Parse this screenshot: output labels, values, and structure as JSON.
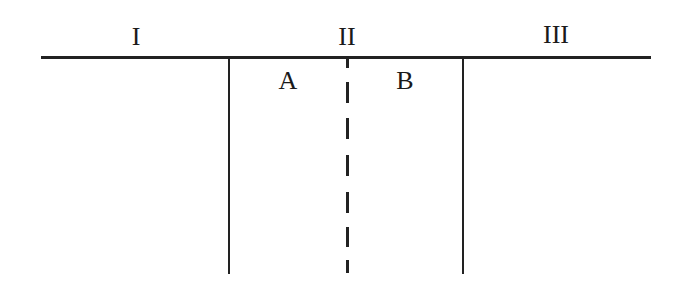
{
  "diagram": {
    "regions": [
      {
        "id": "I",
        "label": "I",
        "x": 136,
        "y": 24
      },
      {
        "id": "II",
        "label": "II",
        "x": 347,
        "y": 24
      },
      {
        "id": "III",
        "label": "III",
        "x": 556,
        "y": 22
      }
    ],
    "subregions": [
      {
        "id": "A",
        "label": "A",
        "x": 288,
        "y": 67
      },
      {
        "id": "B",
        "label": "B",
        "x": 405,
        "y": 67
      }
    ],
    "lines": {
      "top_horizontal": {
        "x1": 41,
        "x2": 651,
        "y": 58,
        "style": "solid"
      },
      "left_vertical": {
        "x": 229,
        "y1": 58,
        "y2": 274,
        "style": "solid"
      },
      "right_vertical": {
        "x": 463,
        "y1": 58,
        "y2": 274,
        "style": "solid"
      },
      "center_divider": {
        "x": 347,
        "y1": 58,
        "y2": 274,
        "style": "dashed"
      }
    },
    "dashes": [
      {
        "y": 58,
        "h": 10
      },
      {
        "y": 82,
        "h": 21
      },
      {
        "y": 118,
        "h": 21
      },
      {
        "y": 155,
        "h": 21
      },
      {
        "y": 192,
        "h": 21
      },
      {
        "y": 227,
        "h": 20
      },
      {
        "y": 260,
        "h": 13
      }
    ],
    "line_color": "#222222"
  }
}
